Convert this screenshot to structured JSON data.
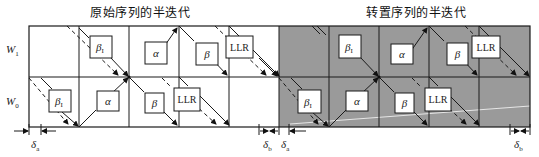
{
  "titles": {
    "left": "原始序列的半迭代",
    "right": "转置序列的半迭代"
  },
  "rows": [
    {
      "label": "W",
      "sub": "1"
    },
    {
      "label": "W",
      "sub": "0"
    }
  ],
  "colors": {
    "background": "#ffffff",
    "shaded_region": "#9a9a9a",
    "line": "#1a1a1a",
    "box_fill": "#ffffff"
  },
  "blocks": {
    "left_half": {
      "W1": [
        "β_I",
        "α",
        "β",
        "LLR"
      ],
      "W0": [
        "β_I",
        "α",
        "β",
        "LLR"
      ]
    },
    "right_half": {
      "W1": [
        "β_I",
        "α",
        "β",
        "LLR"
      ],
      "W0": [
        "β_I",
        "α",
        "β",
        "LLR"
      ]
    }
  },
  "box_labels": {
    "beta_init": "β",
    "beta_init_sub": "I",
    "alpha": "α",
    "beta": "β",
    "llr": "LLR"
  },
  "deltas": [
    {
      "label": "δ",
      "sub": "a",
      "position": "bottom-left"
    },
    {
      "label": "δ",
      "sub": "b",
      "position": "bottom-middle-left"
    },
    {
      "label": "δ",
      "sub": "a",
      "position": "bottom-middle-right"
    },
    {
      "label": "δ",
      "sub": "b",
      "position": "bottom-right"
    }
  ]
}
